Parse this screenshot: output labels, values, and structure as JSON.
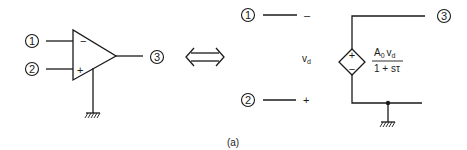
{
  "figure": {
    "caption": "(a)",
    "equivalence_symbol": "⟺"
  },
  "opamp_symbol": {
    "inverting_input_node": "1",
    "noninverting_input_node": "2",
    "output_node": "3",
    "inverting_sign": "−",
    "noninverting_sign": "+",
    "ground": "ground-symbol"
  },
  "equivalent_circuit": {
    "input_node_1": "1",
    "input_node_2": "2",
    "output_node": "3",
    "terminal_1_sign": "–",
    "terminal_2_sign": "+",
    "differential_voltage": {
      "base": "v",
      "subscript": "d"
    },
    "dependent_source": {
      "type": "voltage-controlled voltage source",
      "plus_sign": "+",
      "minus_sign": "−",
      "numerator": {
        "A": "A",
        "A_sub": "0",
        "v": "v",
        "v_sub": "d"
      },
      "denominator": "1 + sτ"
    },
    "ground": "ground-symbol"
  },
  "colors": {
    "stroke": "#1a1a1a",
    "background": "#ffffff"
  }
}
